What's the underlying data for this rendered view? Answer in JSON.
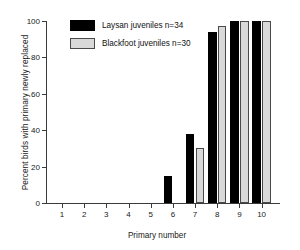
{
  "chart_data": {
    "type": "bar",
    "title": "",
    "xlabel": "Primary number",
    "ylabel": "Percent birds with primary newly replaced",
    "categories": [
      "1",
      "2",
      "3",
      "4",
      "5",
      "6",
      "7",
      "8",
      "9",
      "10"
    ],
    "series": [
      {
        "name": "Laysan juveniles n=34",
        "color": "#000000",
        "values": [
          0,
          0,
          0,
          0,
          0,
          15,
          38,
          94,
          100,
          100
        ]
      },
      {
        "name": "Blackfoot juveniles n=30",
        "color": "#d9d9d9",
        "values": [
          0,
          0,
          0,
          0,
          0,
          0,
          30,
          97,
          100,
          100
        ]
      }
    ],
    "ylim": [
      0,
      100
    ],
    "yticks": [
      0,
      20,
      40,
      60,
      80,
      100
    ],
    "ytick_labels": [
      "0",
      "20",
      "40",
      "60",
      "80",
      "100"
    ],
    "grid": false,
    "legend_position": "top-left"
  }
}
